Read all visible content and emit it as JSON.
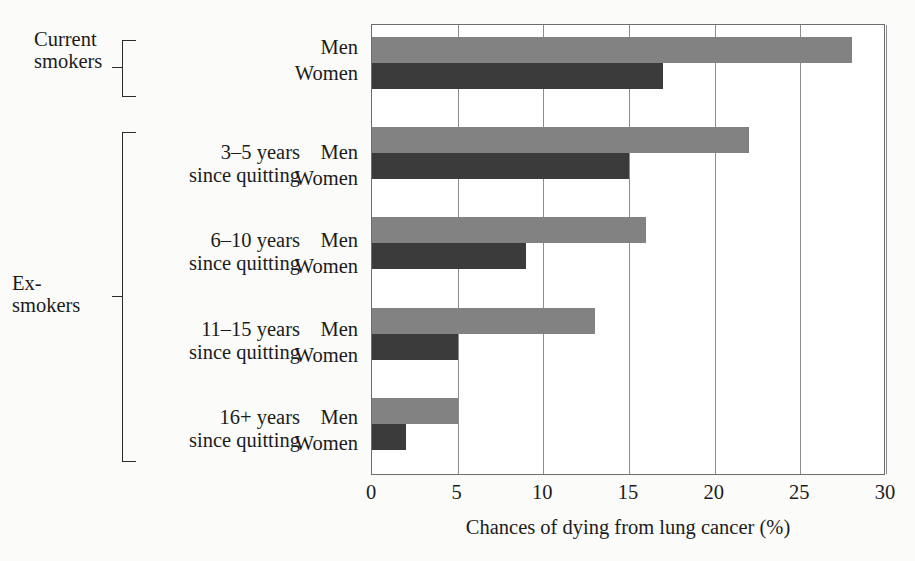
{
  "chart_data": {
    "type": "bar",
    "orientation": "horizontal",
    "title": "",
    "xlabel": "Chances of dying from lung cancer (%)",
    "ylabel": "",
    "xlim": [
      0,
      30
    ],
    "xticks": [
      0,
      5,
      10,
      15,
      20,
      25,
      30
    ],
    "xtick_labels": [
      "0",
      "5",
      "10",
      "15",
      "20",
      "25",
      "30"
    ],
    "grid": "vertical",
    "legend": "none",
    "categories": [
      "Current smokers",
      "3–5 years since quitting",
      "6–10 years since quitting",
      "11–15 years since quitting",
      "16+ years since quitting"
    ],
    "series": [
      {
        "name": "Men",
        "color": "#828282",
        "values": [
          28,
          22,
          16,
          13,
          5
        ]
      },
      {
        "name": "Women",
        "color": "#3b3b3b",
        "values": [
          17,
          15,
          9,
          5,
          2
        ]
      }
    ]
  },
  "groups": [
    {
      "bracket_label": "Current\nsmokers",
      "category_label": "",
      "rows": [
        {
          "series": "Men",
          "label": "Men",
          "value": 28,
          "color": "#828282"
        },
        {
          "series": "Women",
          "label": "Women",
          "value": 17,
          "color": "#3b3b3b"
        }
      ]
    },
    {
      "bracket_label": "",
      "category_label": "3–5 years\nsince quitting",
      "rows": [
        {
          "series": "Men",
          "label": "Men",
          "value": 22,
          "color": "#828282"
        },
        {
          "series": "Women",
          "label": "Women",
          "value": 15,
          "color": "#3b3b3b"
        }
      ]
    },
    {
      "bracket_label": "",
      "category_label": "6–10 years\nsince quitting",
      "rows": [
        {
          "series": "Men",
          "label": "Men",
          "value": 16,
          "color": "#828282"
        },
        {
          "series": "Women",
          "label": "Women",
          "value": 9,
          "color": "#3b3b3b"
        }
      ]
    },
    {
      "bracket_label": "",
      "category_label": "11–15 years\nsince quitting",
      "rows": [
        {
          "series": "Men",
          "label": "Men",
          "value": 13,
          "color": "#828282"
        },
        {
          "series": "Women",
          "label": "Women",
          "value": 5,
          "color": "#3b3b3b"
        }
      ]
    },
    {
      "bracket_label": "",
      "category_label": "16+ years\nsince quitting",
      "rows": [
        {
          "series": "Men",
          "label": "Men",
          "value": 5,
          "color": "#828282"
        },
        {
          "series": "Women",
          "label": "Women",
          "value": 2,
          "color": "#3b3b3b"
        }
      ]
    }
  ],
  "brackets": {
    "current_smokers": "Current\nsmokers",
    "ex_smokers": "Ex-\nsmokers"
  },
  "colors": {
    "men_bar": "#828282",
    "women_bar": "#3b3b3b",
    "grid": "#8d8d8d",
    "axis": "#6d6d6d",
    "page_background": "#fbfbf9",
    "plot_background": "#ffffff",
    "text": "#1b1b1b"
  }
}
